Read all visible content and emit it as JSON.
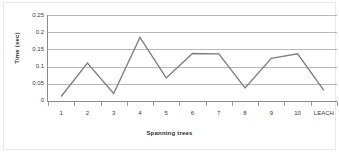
{
  "chart_data": {
    "type": "line",
    "title": "",
    "xlabel": "Spanning trees",
    "ylabel": "Time (sec)",
    "categories": [
      "1",
      "2",
      "3",
      "4",
      "5",
      "6",
      "7",
      "8",
      "9",
      "10",
      "LEACH"
    ],
    "series": [
      {
        "name": "Time (sec)",
        "values": [
          0.013,
          0.11,
          0.022,
          0.185,
          0.067,
          0.138,
          0.137,
          0.038,
          0.124,
          0.137,
          0.031
        ],
        "color": "#7f7f7f"
      }
    ],
    "ylim": [
      0,
      0.25
    ],
    "ytick_labels": [
      "0.25",
      "0.2",
      "0.15",
      "0.1",
      "0.05",
      "0"
    ],
    "ytick_values": [
      0.25,
      0.2,
      0.15,
      0.1,
      0.05,
      0
    ],
    "grid": "horizontal",
    "legend": "none",
    "line_color": "#7f7f7f",
    "gridline_color": "#b8b8b8",
    "axis_color": "#8a8a8a",
    "background_color": "#ffffff"
  }
}
